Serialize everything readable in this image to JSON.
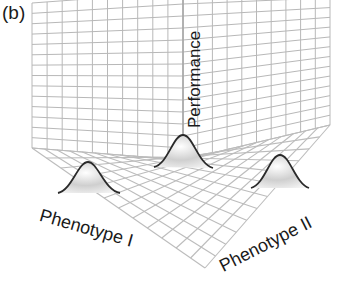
{
  "figure": {
    "panel_label": "(b)",
    "title": "",
    "axes": {
      "vertical": "Performance",
      "left_floor": "Phenotype I",
      "right_floor": "Phenotype II"
    },
    "peaks": [
      {
        "name": "left-peak",
        "position": "Phenotype I axis"
      },
      {
        "name": "center-peak",
        "position": "origin corner"
      },
      {
        "name": "right-peak",
        "position": "Phenotype II axis"
      }
    ],
    "colors": {
      "grid": "#b8b8b8",
      "peak_outline": "#2a2a2a",
      "text": "#1a1a1a",
      "background": "#ffffff"
    }
  }
}
